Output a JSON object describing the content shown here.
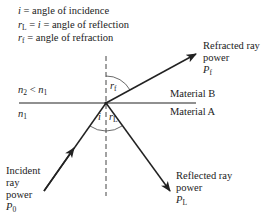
{
  "legend": {
    "incidence": {
      "symbol": "i",
      "text": " = angle of incidence"
    },
    "reflection": {
      "symbol": "r",
      "sub": "L",
      "eq": " = ",
      "symbol2": "i",
      "text": " = angle of reflection"
    },
    "refraction": {
      "symbol": "r",
      "sub": "f",
      "text": " = angle of refraction"
    }
  },
  "media": {
    "upper_condition": {
      "n": "n",
      "sub": "2",
      "rel": " < ",
      "n2": "n",
      "sub2": "1"
    },
    "lower_index": {
      "n": "n",
      "sub": "1"
    },
    "material_b": "Material B",
    "material_a": "Material A"
  },
  "angles": {
    "refraction": {
      "symbol": "r",
      "sub": "f"
    },
    "incidence": {
      "symbol": "i"
    },
    "reflection": {
      "symbol": "r",
      "sub": "L"
    }
  },
  "rays": {
    "refracted": {
      "line1": "Refracted ray",
      "line2": "power",
      "symbol": "P",
      "sub": "f"
    },
    "reflected": {
      "line1": "Reflected ray",
      "line2": "power",
      "symbol": "P",
      "sub": "L"
    },
    "incident": {
      "line1": "Incident",
      "line2": "ray",
      "line3": "power",
      "symbol": "P",
      "sub": "0"
    }
  },
  "colors": {
    "line": "#222222",
    "background": "#ffffff"
  }
}
